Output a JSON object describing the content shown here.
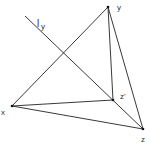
{
  "diagram": {
    "line_color": "#222222",
    "vertices": {
      "y": {
        "x": 108,
        "y": 7,
        "label": "y"
      },
      "x": {
        "x": 12,
        "y": 106,
        "label": "x"
      },
      "z": {
        "x": 143,
        "y": 129,
        "label": "z"
      },
      "z_prime": {
        "x": 113,
        "y": 100,
        "label": "z'"
      }
    },
    "labels": {
      "l_main": "l",
      "l_sub": "y",
      "y": "y",
      "x": "x",
      "z": "z",
      "z_prime": "z'"
    },
    "edges": [
      [
        "x",
        "y"
      ],
      [
        "y",
        "z"
      ],
      [
        "x",
        "z"
      ],
      [
        "y",
        "z_prime"
      ],
      [
        "x",
        "z_prime"
      ],
      [
        "z_prime",
        "z"
      ]
    ],
    "line_l_y": {
      "from": [
        25,
        16
      ],
      "through": "z_prime",
      "to": [
        143,
        129
      ]
    }
  }
}
